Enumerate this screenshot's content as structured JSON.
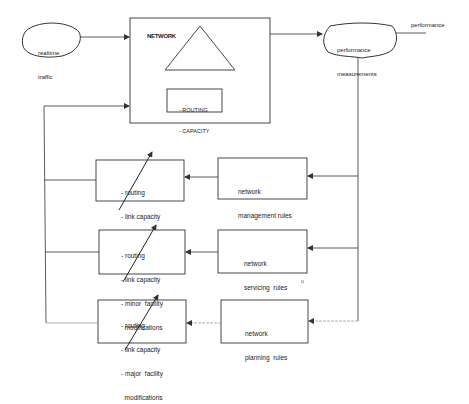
{
  "diagram": {
    "colors": {
      "stroke": "#333333",
      "faint": "#9a9a9a",
      "background": "#ffffff"
    },
    "input": {
      "label_line1": "realtime",
      "label_line2": "traffic"
    },
    "network": {
      "title": "NETWORK",
      "controls_line1": "- ROUTING",
      "controls_line2": "- CAPACITY"
    },
    "measurements": {
      "label_line1": "performance",
      "label_line2": "measurements"
    },
    "output": {
      "label": "performance"
    },
    "rules": [
      {
        "line1": "network",
        "line2": "management rules"
      },
      {
        "line1": "network",
        "line2": "servicing  rules"
      },
      {
        "line1": "network",
        "line2": "planning  rules"
      }
    ],
    "actions": [
      {
        "items": [
          "- routing",
          "- link capacity"
        ]
      },
      {
        "items": [
          "- routing",
          "- link capacity",
          "- minor  facility",
          "  modifications"
        ]
      },
      {
        "items": [
          "- routing",
          "- link capacity",
          "- major  facility",
          "  modifications"
        ]
      }
    ],
    "stray_mark": "u"
  }
}
